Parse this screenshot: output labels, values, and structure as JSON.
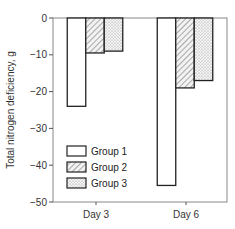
{
  "chart_data": {
    "type": "bar",
    "title": "",
    "xlabel": "",
    "ylabel": "Total nitrogen deficiency, g",
    "ylim": [
      -50,
      0
    ],
    "yticks": [
      0,
      -10,
      -20,
      -30,
      -40,
      -50
    ],
    "ytick_labels": [
      "0",
      "−10",
      "−20",
      "−30",
      "−40",
      "−50"
    ],
    "categories": [
      "Day 3",
      "Day 6"
    ],
    "series": [
      {
        "name": "Group 1",
        "values": [
          -24,
          -45.5
        ],
        "pattern": "blank"
      },
      {
        "name": "Group 2",
        "values": [
          -9.5,
          -19
        ],
        "pattern": "hatched"
      },
      {
        "name": "Group 3",
        "values": [
          -9,
          -17
        ],
        "pattern": "dotted"
      }
    ],
    "grid": false,
    "legend_position": "lower-left inside plot"
  },
  "layout": {
    "plot_left": 53,
    "plot_right": 227,
    "plot_top": 18,
    "plot_bottom": 202,
    "category_centers": [
      96,
      186
    ],
    "bar_width": 18.5
  }
}
